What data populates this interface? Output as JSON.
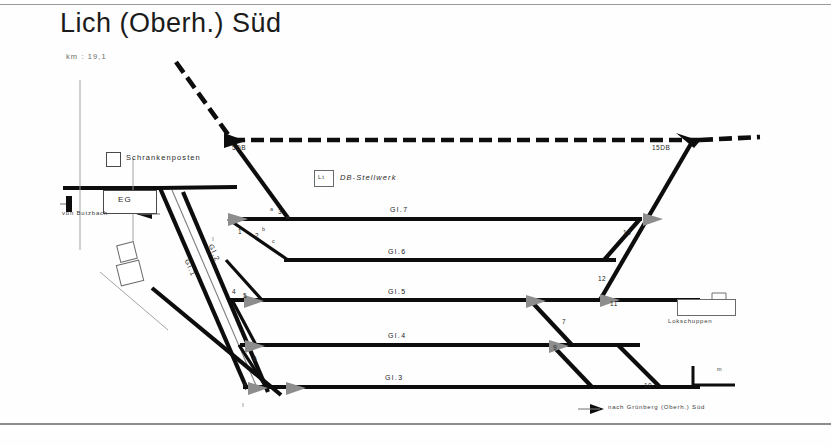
{
  "sheet": {
    "title": "Lich (Oberh.) Süd",
    "km_note": "km : 19,1"
  },
  "facilities": [
    {
      "name": "crossing-keeper-post",
      "label": "Schrankenposten"
    },
    {
      "name": "station-building",
      "label": "EG"
    },
    {
      "name": "signal-box",
      "label": "DB-Stellwerk"
    },
    {
      "name": "signal-box-code",
      "label": "Lt"
    },
    {
      "name": "loco-shed",
      "label": "Lokschuppen"
    }
  ],
  "directions": [
    {
      "name": "from-butzbach",
      "label": "von Butzbach"
    },
    {
      "name": "to-gruenberg",
      "label": "nach Grünberg (Oberh.) Süd"
    }
  ],
  "tracks": [
    {
      "id": "gl1",
      "label": "Gl.1"
    },
    {
      "id": "gl2",
      "label": "Gl.2"
    },
    {
      "id": "gl3",
      "label": "Gl.3"
    },
    {
      "id": "gl4",
      "label": "Gl.4"
    },
    {
      "id": "gl5",
      "label": "Gl.5"
    },
    {
      "id": "gl6",
      "label": "Gl.6"
    },
    {
      "id": "gl7",
      "label": "Gl.7"
    }
  ],
  "turnouts": [
    {
      "id": "w1",
      "label": "1"
    },
    {
      "id": "w2",
      "label": "2"
    },
    {
      "id": "w3",
      "label": "3"
    },
    {
      "id": "w4",
      "label": "4"
    },
    {
      "id": "w5",
      "label": "5"
    },
    {
      "id": "w6",
      "label": "6"
    },
    {
      "id": "w7",
      "label": "7"
    },
    {
      "id": "w8",
      "label": "8"
    },
    {
      "id": "w9",
      "label": "9"
    },
    {
      "id": "w10",
      "label": "10"
    },
    {
      "id": "w11",
      "label": "11"
    },
    {
      "id": "w12",
      "label": "12"
    },
    {
      "id": "w13",
      "label": "13"
    },
    {
      "id": "w5db",
      "label": "5DB"
    },
    {
      "id": "w15db",
      "label": "15DB"
    }
  ],
  "branch_marks": [
    {
      "id": "a",
      "label": "a"
    },
    {
      "id": "b",
      "label": "b"
    },
    {
      "id": "c",
      "label": "c"
    },
    {
      "id": "d",
      "label": "d"
    }
  ],
  "scale": {
    "unit": "m"
  },
  "colors": {
    "ink": "#0d0d0d",
    "paper": "#ffffff",
    "rule": "#9a9a9a",
    "muted": "#7d7d7d"
  }
}
